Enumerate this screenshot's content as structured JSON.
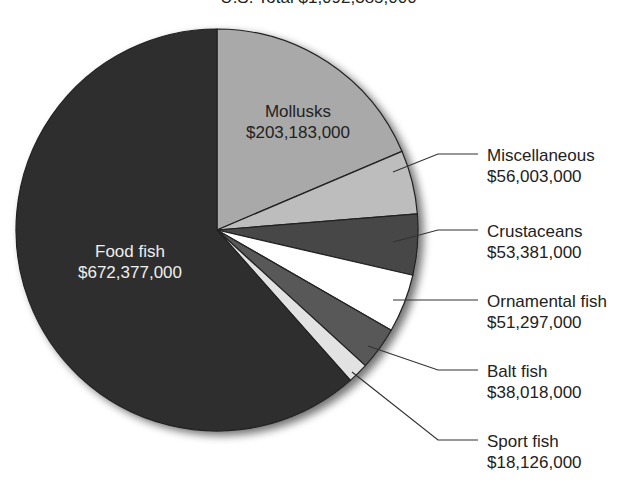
{
  "chart_data": {
    "type": "pie",
    "title": "U.S. Total $1,092,385,000",
    "total": 1092385000,
    "start_angle_deg": -90,
    "direction": "clockwise",
    "slices": [
      {
        "name": "Mollusks",
        "value": 203183000,
        "label": "$203,183,000",
        "color": "#a9a9a9",
        "label_pos": "inside"
      },
      {
        "name": "Miscellaneous",
        "value": 56003000,
        "label": "$56,003,000",
        "color": "#bdbdbd",
        "label_pos": "outside"
      },
      {
        "name": "Crustaceans",
        "value": 53381000,
        "label": "$53,381,000",
        "color": "#474747",
        "label_pos": "outside"
      },
      {
        "name": "Ornamental fish",
        "value": 51297000,
        "label": "$51,297,000",
        "color": "#ffffff",
        "label_pos": "outside"
      },
      {
        "name": "Balt fish",
        "value": 38018000,
        "label": "$38,018,000",
        "color": "#585858",
        "label_pos": "outside"
      },
      {
        "name": "Sport fish",
        "value": 18126000,
        "label": "$18,126,000",
        "color": "#e2e2e2",
        "label_pos": "outside"
      },
      {
        "name": "Food fish",
        "value": 672377000,
        "label": "$672,377,000",
        "color": "#2f2f2f",
        "label_pos": "inside"
      }
    ]
  },
  "labels": {
    "title": "U.S. Total $1,092,385,000",
    "mollusks": {
      "name": "Mollusks",
      "value": "$203,183,000"
    },
    "food_fish": {
      "name": "Food fish",
      "value": "$672,377,000"
    },
    "miscellaneous": {
      "name": "Miscellaneous",
      "value": "$56,003,000"
    },
    "crustaceans": {
      "name": "Crustaceans",
      "value": "$53,381,000"
    },
    "ornamental_fish": {
      "name": "Ornamental fish",
      "value": "$51,297,000"
    },
    "balt_fish": {
      "name": "Balt fish",
      "value": "$38,018,000"
    },
    "sport_fish": {
      "name": "Sport fish",
      "value": "$18,126,000"
    }
  }
}
